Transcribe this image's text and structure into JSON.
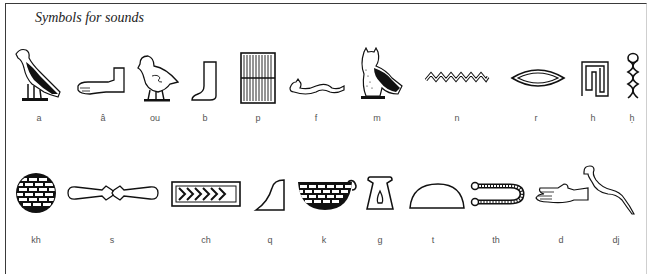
{
  "title": "Symbols for sounds",
  "row1": [
    {
      "label": "a",
      "icon": "vulture-icon"
    },
    {
      "label": "â",
      "icon": "forearm-icon"
    },
    {
      "label": "ou",
      "icon": "quail-chick-icon"
    },
    {
      "label": "b",
      "icon": "foot-icon"
    },
    {
      "label": "p",
      "icon": "stool-mat-icon"
    },
    {
      "label": "f",
      "icon": "horned-viper-icon"
    },
    {
      "label": "m",
      "icon": "owl-icon"
    },
    {
      "label": "n",
      "icon": "water-ripple-icon"
    },
    {
      "label": "r",
      "icon": "mouth-icon"
    },
    {
      "label": "h",
      "icon": "reed-shelter-icon"
    },
    {
      "label": "ḥ",
      "icon": "twisted-flax-icon"
    }
  ],
  "row2": [
    {
      "label": "kh",
      "icon": "placenta-sieve-icon"
    },
    {
      "label": "s",
      "icon": "door-bolt-icon"
    },
    {
      "label": "ch",
      "icon": "pool-icon"
    },
    {
      "label": "q",
      "icon": "hill-slope-icon"
    },
    {
      "label": "k",
      "icon": "basket-with-handle-icon"
    },
    {
      "label": "g",
      "icon": "jar-stand-icon"
    },
    {
      "label": "t",
      "icon": "bread-loaf-icon"
    },
    {
      "label": "th",
      "icon": "tethering-rope-icon"
    },
    {
      "label": "d",
      "icon": "hand-icon"
    },
    {
      "label": "dj",
      "icon": "cobra-icon"
    }
  ]
}
